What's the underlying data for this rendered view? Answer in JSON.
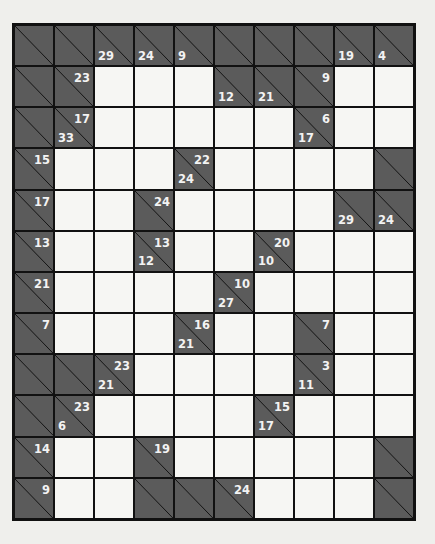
{
  "puzzle": {
    "type": "kakuro",
    "columns": 10,
    "rows": 12,
    "colors": {
      "clue_cell": "#5b5b5b",
      "entry_cell": "#f6f6f3",
      "grid_line": "#111111",
      "clue_text": "#f3f3f3",
      "page": "#efefec"
    },
    "grid": [
      [
        {
          "t": "b"
        },
        {
          "t": "b"
        },
        {
          "t": "b",
          "d": "29"
        },
        {
          "t": "b",
          "d": "24"
        },
        {
          "t": "b",
          "d": "9"
        },
        {
          "t": "b"
        },
        {
          "t": "b"
        },
        {
          "t": "b"
        },
        {
          "t": "b",
          "d": "19"
        },
        {
          "t": "b",
          "d": "4"
        }
      ],
      [
        {
          "t": "b"
        },
        {
          "t": "b",
          "r": "23"
        },
        {
          "t": "w"
        },
        {
          "t": "w"
        },
        {
          "t": "w"
        },
        {
          "t": "b",
          "d": "12"
        },
        {
          "t": "b",
          "d": "21"
        },
        {
          "t": "b",
          "r": "9"
        },
        {
          "t": "w"
        },
        {
          "t": "w"
        }
      ],
      [
        {
          "t": "b"
        },
        {
          "t": "b",
          "r": "17",
          "d": "33"
        },
        {
          "t": "w"
        },
        {
          "t": "w"
        },
        {
          "t": "w"
        },
        {
          "t": "w"
        },
        {
          "t": "w"
        },
        {
          "t": "b",
          "r": "6",
          "d": "17"
        },
        {
          "t": "w"
        },
        {
          "t": "w"
        }
      ],
      [
        {
          "t": "b",
          "r": "15"
        },
        {
          "t": "w"
        },
        {
          "t": "w"
        },
        {
          "t": "w"
        },
        {
          "t": "b",
          "r": "22",
          "d": "24"
        },
        {
          "t": "w"
        },
        {
          "t": "w"
        },
        {
          "t": "w"
        },
        {
          "t": "w"
        },
        {
          "t": "b"
        }
      ],
      [
        {
          "t": "b",
          "r": "17"
        },
        {
          "t": "w"
        },
        {
          "t": "w"
        },
        {
          "t": "b",
          "r": "24"
        },
        {
          "t": "w"
        },
        {
          "t": "w"
        },
        {
          "t": "w"
        },
        {
          "t": "w"
        },
        {
          "t": "b",
          "d": "29"
        },
        {
          "t": "b",
          "d": "24"
        }
      ],
      [
        {
          "t": "b",
          "r": "13"
        },
        {
          "t": "w"
        },
        {
          "t": "w"
        },
        {
          "t": "b",
          "r": "13",
          "d": "12"
        },
        {
          "t": "w"
        },
        {
          "t": "w"
        },
        {
          "t": "b",
          "r": "20",
          "d": "10"
        },
        {
          "t": "w"
        },
        {
          "t": "w"
        },
        {
          "t": "w"
        }
      ],
      [
        {
          "t": "b",
          "r": "21"
        },
        {
          "t": "w"
        },
        {
          "t": "w"
        },
        {
          "t": "w"
        },
        {
          "t": "w"
        },
        {
          "t": "b",
          "r": "10",
          "d": "27"
        },
        {
          "t": "w"
        },
        {
          "t": "w"
        },
        {
          "t": "w"
        },
        {
          "t": "w"
        }
      ],
      [
        {
          "t": "b",
          "r": "7"
        },
        {
          "t": "w"
        },
        {
          "t": "w"
        },
        {
          "t": "w"
        },
        {
          "t": "b",
          "r": "16",
          "d": "21"
        },
        {
          "t": "w"
        },
        {
          "t": "w"
        },
        {
          "t": "b",
          "r": "7"
        },
        {
          "t": "w"
        },
        {
          "t": "w"
        }
      ],
      [
        {
          "t": "b"
        },
        {
          "t": "b"
        },
        {
          "t": "b",
          "r": "23",
          "d": "21"
        },
        {
          "t": "w"
        },
        {
          "t": "w"
        },
        {
          "t": "w"
        },
        {
          "t": "w"
        },
        {
          "t": "b",
          "r": "3",
          "d": "11"
        },
        {
          "t": "w"
        },
        {
          "t": "w"
        }
      ],
      [
        {
          "t": "b"
        },
        {
          "t": "b",
          "r": "23",
          "d": "6"
        },
        {
          "t": "w"
        },
        {
          "t": "w"
        },
        {
          "t": "w"
        },
        {
          "t": "w"
        },
        {
          "t": "b",
          "r": "15",
          "d": "17"
        },
        {
          "t": "w"
        },
        {
          "t": "w"
        },
        {
          "t": "w"
        }
      ],
      [
        {
          "t": "b",
          "r": "14"
        },
        {
          "t": "w"
        },
        {
          "t": "w"
        },
        {
          "t": "b",
          "r": "19"
        },
        {
          "t": "w"
        },
        {
          "t": "w"
        },
        {
          "t": "w"
        },
        {
          "t": "w"
        },
        {
          "t": "w"
        },
        {
          "t": "b"
        }
      ],
      [
        {
          "t": "b",
          "r": "9"
        },
        {
          "t": "w"
        },
        {
          "t": "w"
        },
        {
          "t": "b"
        },
        {
          "t": "b"
        },
        {
          "t": "b",
          "r": "24"
        },
        {
          "t": "w"
        },
        {
          "t": "w"
        },
        {
          "t": "w"
        },
        {
          "t": "b"
        }
      ]
    ]
  }
}
